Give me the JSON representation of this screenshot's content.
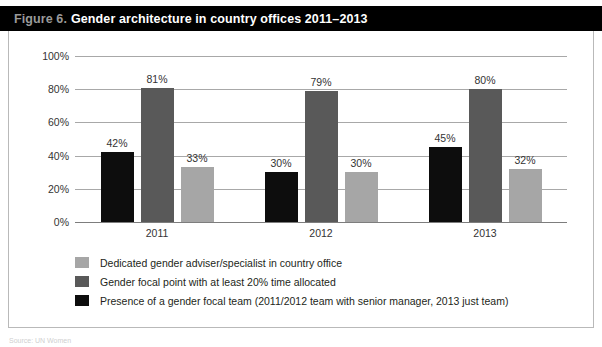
{
  "figure": {
    "number_label": "Figure 6.",
    "title": "Gender architecture in country offices 2011–2013"
  },
  "source_caption": "Source: UN Women",
  "colors": {
    "series_focal_team": "#0d0d0d",
    "series_focal_point": "#595959",
    "series_adviser": "#a6a6a6",
    "title_bar_background": "#000000",
    "title_number_text": "#9a9a9a",
    "title_text": "#ffffff",
    "gridline": "#a8a8a8",
    "axis_line": "#7d7d7d",
    "border": "#b9b9b9"
  },
  "legend": {
    "items": [
      {
        "label": "Dedicated gender adviser/specialist in country office",
        "color": "#a6a6a6",
        "swatch_name": "legend-swatch-adviser"
      },
      {
        "label": "Gender focal point with at least 20% time allocated",
        "color": "#595959",
        "swatch_name": "legend-swatch-focal-point"
      },
      {
        "label": "Presence of a gender focal team (2011/2012 team with senior manager, 2013 just team)",
        "color": "#0d0d0d",
        "swatch_name": "legend-swatch-focal-team"
      }
    ]
  },
  "chart_data": {
    "type": "bar",
    "title": "Gender architecture in country offices 2011–2013",
    "xlabel": "",
    "ylabel": "",
    "ylim": [
      0,
      100
    ],
    "yticks": [
      0,
      20,
      40,
      60,
      80,
      100
    ],
    "ytick_labels": [
      "0%",
      "20%",
      "40%",
      "60%",
      "80%",
      "100%"
    ],
    "grid": true,
    "legend_position": "bottom-left",
    "categories": [
      "2011",
      "2012",
      "2013"
    ],
    "series": [
      {
        "name": "Presence of a gender focal team (2011/2012 team with senior manager, 2013 just team)",
        "color": "#0d0d0d",
        "values": [
          42,
          30,
          45
        ],
        "data_labels": [
          "42%",
          "30%",
          "45%"
        ]
      },
      {
        "name": "Gender focal point with at least 20% time allocated",
        "color": "#595959",
        "values": [
          81,
          79,
          80
        ],
        "data_labels": [
          "81%",
          "79%",
          "80%"
        ]
      },
      {
        "name": "Dedicated gender adviser/specialist in country office",
        "color": "#a6a6a6",
        "values": [
          33,
          30,
          32
        ],
        "data_labels": [
          "33%",
          "30%",
          "32%"
        ]
      }
    ]
  }
}
